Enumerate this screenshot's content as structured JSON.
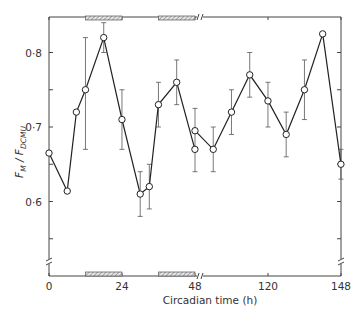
{
  "chart_data": {
    "type": "line",
    "title": "",
    "xlabel": "Circadian time (h)",
    "ylabel": "F_M / F_DCMU",
    "ylim": [
      0.52,
      0.85
    ],
    "xlim": [
      0,
      148
    ],
    "x_axis_break": [
      48,
      96
    ],
    "y_axis_break_below": 0.55,
    "grid": false,
    "legend": null,
    "x_ticks": [
      0,
      24,
      48,
      120,
      148
    ],
    "x_tick_labels": [
      "0",
      "24",
      "48",
      "120",
      "148"
    ],
    "y_ticks": [
      0.6,
      0.7,
      0.8
    ],
    "y_tick_labels": [
      "0·6",
      "0·7",
      "0·8"
    ],
    "y_minor_ticks": [
      0.55,
      0.65,
      0.75
    ],
    "dark_periods": [
      [
        12,
        24
      ],
      [
        36,
        48
      ]
    ],
    "series": [
      {
        "name": "segment-1",
        "x": [
          0,
          6,
          9,
          12,
          18,
          24,
          30,
          33,
          36,
          42,
          48
        ],
        "values": [
          0.665,
          0.614,
          0.72,
          0.75,
          0.82,
          0.71,
          0.61,
          0.62,
          0.73,
          0.76,
          0.67
        ],
        "err_low": [
          null,
          null,
          null,
          0.67,
          0.8,
          0.67,
          0.58,
          0.59,
          0.7,
          0.73,
          null
        ],
        "err_high": [
          null,
          null,
          null,
          0.82,
          0.84,
          0.75,
          0.64,
          0.65,
          0.76,
          0.79,
          null
        ]
      },
      {
        "name": "segment-2",
        "x": [
          96,
          102,
          108,
          114,
          120,
          126,
          132,
          138,
          144
        ],
        "values": [
          0.695,
          0.67,
          0.72,
          0.77,
          0.735,
          0.69,
          0.75,
          0.825,
          0.65
        ],
        "err_low": [
          0.64,
          0.64,
          0.69,
          0.74,
          0.7,
          0.66,
          0.71,
          null,
          0.63
        ],
        "err_high": [
          0.725,
          0.7,
          0.75,
          0.8,
          0.76,
          0.72,
          0.79,
          null,
          0.67
        ]
      }
    ]
  }
}
